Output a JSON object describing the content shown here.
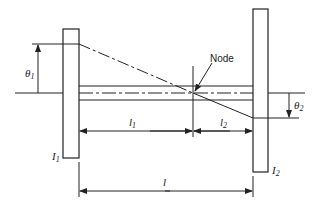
{
  "diagram": {
    "labels": {
      "node": "Node",
      "theta1": "θ",
      "theta1_sub": "1",
      "theta2": "θ",
      "theta2_sub": "2",
      "l1": "l",
      "l1_sub": "1",
      "l2": "l",
      "l2_sub": "2",
      "l": "l",
      "I1": "I",
      "I1_sub": "1",
      "I2": "I",
      "I2_sub": "2"
    },
    "components": [
      "left disk I1",
      "right disk I2",
      "shaft",
      "node point",
      "amplitude line"
    ],
    "colors": {
      "line": "#222222",
      "background": "#ffffff"
    }
  }
}
